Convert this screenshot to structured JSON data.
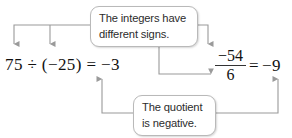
{
  "diagram": {
    "line_color": "#9a9a9a",
    "box_border_color": "#b9b9b9",
    "text_color": "#2c2c2c",
    "math_color": "#111111",
    "callouts": [
      {
        "id": "signs",
        "line1": "The integers have",
        "line2": "different signs."
      },
      {
        "id": "quotient",
        "line1": "The quotient",
        "line2": "is negative."
      }
    ],
    "equations": {
      "left": {
        "text": "75 ÷ (−25) = −3",
        "dividend": "75",
        "divisor": "(−25)",
        "quotient": "−3"
      },
      "right": {
        "numerator": "−54",
        "denominator": "6",
        "equals": "=",
        "quotient": "−9"
      }
    }
  }
}
